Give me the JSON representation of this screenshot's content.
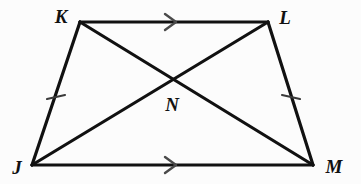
{
  "figure": {
    "name": "trapezoid-jklm-with-diagonals",
    "background_color": "#fcfcfc",
    "stroke_color": "#111111",
    "tick_color": "#3a3a3a",
    "arrow_color": "#4a4a4a",
    "width": 361,
    "height": 184
  },
  "labels": {
    "k": "K",
    "l": "L",
    "j": "J",
    "m": "M",
    "n": "N"
  },
  "label_positions": {
    "k": {
      "x": 61,
      "y": 16
    },
    "l": {
      "x": 285,
      "y": 17
    },
    "j": {
      "x": 17,
      "y": 167
    },
    "m": {
      "x": 334,
      "y": 166
    },
    "n": {
      "x": 172,
      "y": 104
    }
  },
  "vertices": {
    "K": {
      "x": 80,
      "y": 22
    },
    "L": {
      "x": 268,
      "y": 22
    },
    "J": {
      "x": 32,
      "y": 165
    },
    "M": {
      "x": 313,
      "y": 165
    },
    "N": {
      "x": 175,
      "y": 80
    }
  },
  "edges": [
    {
      "name": "edge-kl",
      "from": "K",
      "to": "L",
      "kind": "side"
    },
    {
      "name": "edge-lm",
      "from": "L",
      "to": "M",
      "kind": "leg"
    },
    {
      "name": "edge-mj",
      "from": "M",
      "to": "J",
      "kind": "side"
    },
    {
      "name": "edge-jk",
      "from": "J",
      "to": "K",
      "kind": "leg"
    }
  ],
  "diagonals": [
    {
      "name": "diagonal-jl",
      "from": "J",
      "to": "L"
    },
    {
      "name": "diagonal-km",
      "from": "K",
      "to": "M"
    }
  ],
  "tick_marks": [
    {
      "name": "tick-jk",
      "x": 56,
      "y": 97,
      "count": 1,
      "on_edge": "edge-jk"
    },
    {
      "name": "tick-lm",
      "x": 291,
      "y": 97,
      "count": 1,
      "on_edge": "edge-lm"
    }
  ],
  "parallel_arrows": [
    {
      "name": "arrow-kl",
      "x": 172,
      "y": 22,
      "on_edge": "edge-kl",
      "direction": "right"
    },
    {
      "name": "arrow-jm",
      "x": 172,
      "y": 165,
      "on_edge": "edge-mj",
      "direction": "right"
    }
  ]
}
